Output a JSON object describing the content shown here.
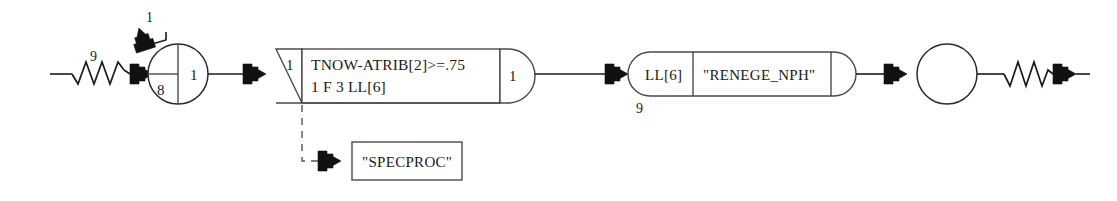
{
  "diagram": {
    "type": "slam-network",
    "canvas": {
      "width": 1117,
      "height": 201,
      "background": "#ffffff"
    },
    "colors": {
      "line": "#1b1b1b",
      "shape_stroke": "#2a2a2a",
      "shape_fill": "#ffffff",
      "arrow_fill": "#111111",
      "dashed": "#555555",
      "text": "#1a1a1a"
    },
    "nodes": {
      "source_zigzag": {
        "name": "source-zigzag",
        "label": "9"
      },
      "top_branch": {
        "name": "top-branch-arrow",
        "label": "1"
      },
      "split_circle": {
        "name": "split-circle-node",
        "lower_left_label": "8",
        "right_label": "1"
      },
      "decision_block": {
        "name": "decision-block",
        "wedge_label": "1",
        "expression_line1": "TNOW-ATRIB[2]>=.75",
        "expression_line2": "1  F  3  LL[6]",
        "cap_label": "1"
      },
      "specproc_box": {
        "name": "specproc-box",
        "label": "\"SPECPROC\""
      },
      "renege_block": {
        "name": "renege-block",
        "left_label": "LL[6]",
        "right_label": "\"RENEGE_NPH\"",
        "below_label": "9"
      },
      "terminal_circle": {
        "name": "terminal-circle-node",
        "label": ""
      },
      "sink_zigzag": {
        "name": "sink-zigzag",
        "label": ""
      }
    }
  }
}
